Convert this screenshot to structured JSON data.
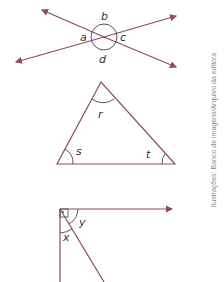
{
  "figures": [
    {
      "name": "intersecting-lines",
      "labels": {
        "top": "b",
        "left": "a",
        "right": "c",
        "bottom": "d"
      }
    },
    {
      "name": "triangle",
      "labels": {
        "top": "r",
        "left": "s",
        "right": "t"
      }
    },
    {
      "name": "right-angle-split",
      "labels": {
        "lower": "x",
        "upper": "y"
      }
    }
  ],
  "credit": "Ilustrações: Banco de imagens/Arquivo da editora",
  "colors": {
    "line": "#8b4a6b",
    "arc": "#444444"
  }
}
